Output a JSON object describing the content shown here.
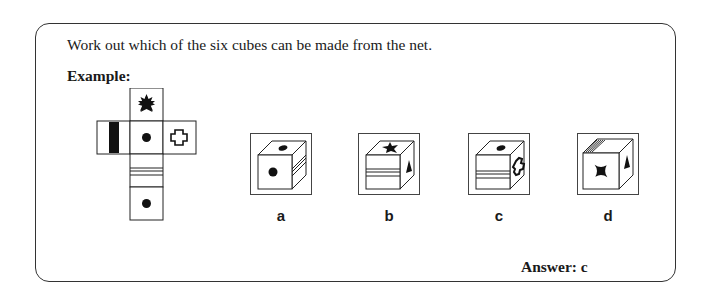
{
  "question": {
    "instruction": "Work out which of the six cubes can be made from the net.",
    "example_label": "Example:"
  },
  "net": {
    "faces": [
      {
        "position": "top",
        "symbol": "six-point-star-icon"
      },
      {
        "position": "left",
        "symbol": "vertical-black-bar-icon"
      },
      {
        "position": "center",
        "symbol": "black-dot-icon"
      },
      {
        "position": "right",
        "symbol": "outline-cross-icon"
      },
      {
        "position": "below-center",
        "symbol": "horizontal-double-lines-icon"
      },
      {
        "position": "bottom",
        "symbol": "black-dot-icon"
      }
    ]
  },
  "options": [
    {
      "label": "a",
      "front": "black-dot",
      "top": "black-dot",
      "side": "horizontal-lines"
    },
    {
      "label": "b",
      "front": "horizontal-lines",
      "top": "four-point-star",
      "side": "triangle"
    },
    {
      "label": "c",
      "front": "horizontal-lines",
      "top": "black-dot",
      "side": "outline-cross"
    },
    {
      "label": "d",
      "front": "four-point-star",
      "top": "diagonal-lines",
      "side": "triangle"
    }
  ],
  "answer": {
    "text": "Answer: c"
  }
}
